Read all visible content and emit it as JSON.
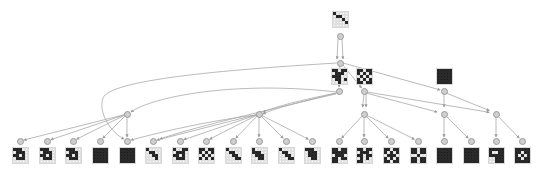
{
  "diagram": {
    "type": "search-tree",
    "colors": {
      "edge": "#a8a8a8",
      "node_fill": "#cfcfcf",
      "node_stroke": "#9a9a9a",
      "cell_on": "#1c1c1c",
      "cell_off": "#ffffff"
    },
    "root": {
      "id": "root",
      "x": 340,
      "y": 20,
      "pattern": [
        "10000",
        "01100",
        "00010",
        "00001",
        "00000"
      ]
    },
    "level1": [
      {
        "id": "l1a",
        "x": 339,
        "y": 77,
        "pattern": [
          "11011",
          "01110",
          "11100",
          "01101",
          "00100"
        ]
      },
      {
        "id": "l1b",
        "x": 364,
        "y": 77,
        "pattern": [
          "11011",
          "10101",
          "01010",
          "10101",
          "11011"
        ]
      },
      {
        "id": "l1c",
        "x": 444,
        "y": 77,
        "pattern": [
          "11111",
          "11111",
          "11111",
          "11111",
          "11111"
        ]
      }
    ],
    "hubs": [
      {
        "id": "h1",
        "x": 127,
        "y": 114
      },
      {
        "id": "h2",
        "x": 259,
        "y": 114
      },
      {
        "id": "h3",
        "x": 364,
        "y": 114
      },
      {
        "id": "h4",
        "x": 444,
        "y": 114
      },
      {
        "id": "h5",
        "x": 496,
        "y": 114
      }
    ],
    "leaves": [
      {
        "x": 20,
        "pattern": [
          "11100",
          "01110",
          "11010",
          "01110",
          "00000"
        ]
      },
      {
        "x": 47,
        "pattern": [
          "11100",
          "01110",
          "11010",
          "01110",
          "00000"
        ]
      },
      {
        "x": 73,
        "pattern": [
          "11100",
          "01110",
          "11010",
          "01110",
          "00000"
        ]
      },
      {
        "x": 100,
        "pattern": [
          "11111",
          "11111",
          "11111",
          "11111",
          "11111"
        ]
      },
      {
        "x": 127,
        "pattern": [
          "11111",
          "11111",
          "11111",
          "11111",
          "11111"
        ]
      },
      {
        "x": 153,
        "pattern": [
          "10000",
          "01100",
          "00110",
          "00010",
          "00000"
        ]
      },
      {
        "x": 180,
        "pattern": [
          "10011",
          "01110",
          "11010",
          "01110",
          "00000"
        ]
      },
      {
        "x": 206,
        "pattern": [
          "11011",
          "10101",
          "01010",
          "10101",
          "00000"
        ]
      },
      {
        "x": 233,
        "pattern": [
          "10000",
          "01100",
          "00110",
          "00011",
          "00000"
        ]
      },
      {
        "x": 259,
        "pattern": [
          "10000",
          "11100",
          "01110",
          "00110",
          "00000"
        ]
      },
      {
        "x": 286,
        "pattern": [
          "10000",
          "01100",
          "00110",
          "00011",
          "00000"
        ]
      },
      {
        "x": 312,
        "pattern": [
          "11100",
          "01110",
          "01110",
          "00110",
          "00000"
        ]
      },
      {
        "x": 339,
        "pattern": [
          "11011",
          "11111",
          "01110",
          "11011",
          "11000"
        ]
      },
      {
        "x": 364,
        "pattern": [
          "11011",
          "01110",
          "11011",
          "01010",
          "11000"
        ]
      },
      {
        "x": 391,
        "pattern": [
          "11011",
          "10101",
          "01110",
          "10101",
          "11011"
        ]
      },
      {
        "x": 418,
        "pattern": [
          "11011",
          "11011",
          "00100",
          "11011",
          "11011"
        ]
      },
      {
        "x": 444,
        "pattern": [
          "11111",
          "11111",
          "11111",
          "11111",
          "11111"
        ]
      },
      {
        "x": 471,
        "pattern": [
          "11111",
          "11111",
          "11111",
          "11111",
          "11111"
        ]
      },
      {
        "x": 496,
        "pattern": [
          "11111",
          "10011",
          "11111",
          "00111",
          "00111"
        ]
      },
      {
        "x": 522,
        "pattern": [
          "11111",
          "11011",
          "10101",
          "11011",
          "11111"
        ]
      }
    ],
    "leaf_hub": [
      1,
      1,
      1,
      1,
      1,
      2,
      2,
      2,
      2,
      2,
      2,
      2,
      3,
      3,
      3,
      3,
      4,
      4,
      5,
      5
    ]
  }
}
